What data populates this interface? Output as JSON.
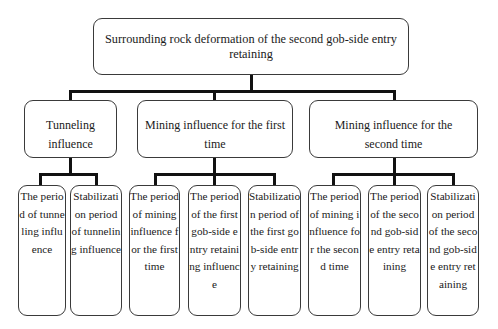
{
  "diagram": {
    "type": "tree",
    "root": {
      "label": "Surrounding rock deformation of the second gob-side entry retaining"
    },
    "level2": [
      {
        "label": "Tunneling influence"
      },
      {
        "label": "Mining influence for the first time"
      },
      {
        "label": "Mining influence for the second time"
      }
    ],
    "level3": [
      {
        "parent": 0,
        "label": "The period of tunneling influence"
      },
      {
        "parent": 0,
        "label": "Stabilization period of tunneling influence"
      },
      {
        "parent": 1,
        "label": "The period of mining influence for the first time"
      },
      {
        "parent": 1,
        "label": "The period of the first gob-side entry retaining influence"
      },
      {
        "parent": 1,
        "label": "Stabilization period of the first gob-side entry retaining"
      },
      {
        "parent": 2,
        "label": "The period of mining influence for the second time"
      },
      {
        "parent": 2,
        "label": "The period of the second gob-side entry retaining"
      },
      {
        "parent": 2,
        "label": "Stabilization period of the second gob-side entry retaining"
      }
    ]
  },
  "colors": {
    "connector": "#111111",
    "box_border": "#3a3a3a",
    "background": "#ffffff"
  }
}
